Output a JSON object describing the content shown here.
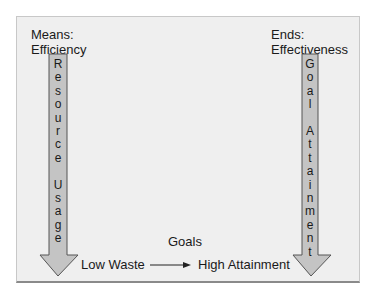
{
  "left": {
    "heading_line1": "Means:",
    "heading_line2": "Efficiency",
    "arrow_text": [
      "R",
      "e",
      "s",
      "o",
      "u",
      "r",
      "c",
      "e",
      " ",
      "U",
      "s",
      "a",
      "g",
      "e"
    ]
  },
  "right": {
    "heading_line1": "Ends:",
    "heading_line2": "Effectiveness",
    "arrow_text": [
      "G",
      "o",
      "a",
      "l",
      " ",
      "A",
      "t",
      "t",
      "a",
      "i",
      "n",
      "m",
      "e",
      "n",
      "t"
    ]
  },
  "bottom": {
    "start_label": "Low Waste",
    "connector_label": "Goals",
    "end_label": "High Attainment"
  },
  "colors": {
    "panel_bg": "#efefef",
    "arrow_fill": "#c4c4c4",
    "arrow_stroke": "#555555"
  }
}
